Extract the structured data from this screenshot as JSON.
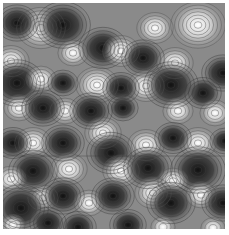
{
  "figure": {
    "background_gray": "#8a8a8a",
    "contour_line_color": "#3a3a3a",
    "colormap": [
      "#111111",
      "#8a8a8a",
      "#ffffff"
    ]
  },
  "blobs": [
    {
      "x": 38,
      "y": 25,
      "r": 16,
      "kind": "max"
    },
    {
      "x": 60,
      "y": 22,
      "r": 18,
      "kind": "min"
    },
    {
      "x": 14,
      "y": 20,
      "r": 14,
      "kind": "min"
    },
    {
      "x": 70,
      "y": 50,
      "r": 10,
      "kind": "max"
    },
    {
      "x": 8,
      "y": 58,
      "r": 12,
      "kind": "max"
    },
    {
      "x": 14,
      "y": 80,
      "r": 18,
      "kind": "min"
    },
    {
      "x": 38,
      "y": 76,
      "r": 10,
      "kind": "max"
    },
    {
      "x": 60,
      "y": 80,
      "r": 10,
      "kind": "min"
    },
    {
      "x": 94,
      "y": 82,
      "r": 14,
      "kind": "max"
    },
    {
      "x": 100,
      "y": 45,
      "r": 16,
      "kind": "min"
    },
    {
      "x": 16,
      "y": 105,
      "r": 10,
      "kind": "max"
    },
    {
      "x": 62,
      "y": 108,
      "r": 10,
      "kind": "max"
    },
    {
      "x": 40,
      "y": 105,
      "r": 14,
      "kind": "min"
    },
    {
      "x": 88,
      "y": 108,
      "r": 14,
      "kind": "min"
    },
    {
      "x": 152,
      "y": 25,
      "r": 12,
      "kind": "max"
    },
    {
      "x": 195,
      "y": 22,
      "r": 18,
      "kind": "max"
    },
    {
      "x": 220,
      "y": 70,
      "r": 14,
      "kind": "min"
    },
    {
      "x": 118,
      "y": 48,
      "r": 12,
      "kind": "max"
    },
    {
      "x": 140,
      "y": 55,
      "r": 14,
      "kind": "min"
    },
    {
      "x": 172,
      "y": 60,
      "r": 12,
      "kind": "max"
    },
    {
      "x": 200,
      "y": 90,
      "r": 12,
      "kind": "min"
    },
    {
      "x": 143,
      "y": 83,
      "r": 12,
      "kind": "max"
    },
    {
      "x": 118,
      "y": 85,
      "r": 12,
      "kind": "min"
    },
    {
      "x": 168,
      "y": 82,
      "r": 18,
      "kind": "min"
    },
    {
      "x": 175,
      "y": 108,
      "r": 10,
      "kind": "max"
    },
    {
      "x": 212,
      "y": 110,
      "r": 10,
      "kind": "max"
    },
    {
      "x": 120,
      "y": 105,
      "r": 10,
      "kind": "min"
    },
    {
      "x": 30,
      "y": 140,
      "r": 12,
      "kind": "max"
    },
    {
      "x": 60,
      "y": 140,
      "r": 14,
      "kind": "min"
    },
    {
      "x": 10,
      "y": 140,
      "r": 12,
      "kind": "min"
    },
    {
      "x": 100,
      "y": 130,
      "r": 12,
      "kind": "max"
    },
    {
      "x": 108,
      "y": 150,
      "r": 16,
      "kind": "min"
    },
    {
      "x": 143,
      "y": 142,
      "r": 12,
      "kind": "max"
    },
    {
      "x": 195,
      "y": 140,
      "r": 12,
      "kind": "max"
    },
    {
      "x": 170,
      "y": 135,
      "r": 12,
      "kind": "min"
    },
    {
      "x": 222,
      "y": 138,
      "r": 10,
      "kind": "min"
    },
    {
      "x": 30,
      "y": 168,
      "r": 16,
      "kind": "min"
    },
    {
      "x": 66,
      "y": 166,
      "r": 12,
      "kind": "max"
    },
    {
      "x": 8,
      "y": 176,
      "r": 10,
      "kind": "max"
    },
    {
      "x": 118,
      "y": 168,
      "r": 12,
      "kind": "max"
    },
    {
      "x": 145,
      "y": 165,
      "r": 16,
      "kind": "min"
    },
    {
      "x": 195,
      "y": 167,
      "r": 18,
      "kind": "min"
    },
    {
      "x": 170,
      "y": 178,
      "r": 10,
      "kind": "max"
    },
    {
      "x": 40,
      "y": 195,
      "r": 10,
      "kind": "max"
    },
    {
      "x": 60,
      "y": 193,
      "r": 14,
      "kind": "min"
    },
    {
      "x": 18,
      "y": 205,
      "r": 18,
      "kind": "min"
    },
    {
      "x": 86,
      "y": 200,
      "r": 10,
      "kind": "max"
    },
    {
      "x": 110,
      "y": 193,
      "r": 14,
      "kind": "min"
    },
    {
      "x": 150,
      "y": 190,
      "r": 12,
      "kind": "max"
    },
    {
      "x": 168,
      "y": 200,
      "r": 16,
      "kind": "min"
    },
    {
      "x": 198,
      "y": 192,
      "r": 10,
      "kind": "max"
    },
    {
      "x": 220,
      "y": 200,
      "r": 14,
      "kind": "min"
    },
    {
      "x": 10,
      "y": 222,
      "r": 8,
      "kind": "max"
    },
    {
      "x": 45,
      "y": 220,
      "r": 12,
      "kind": "min"
    },
    {
      "x": 75,
      "y": 224,
      "r": 12,
      "kind": "min"
    },
    {
      "x": 160,
      "y": 224,
      "r": 8,
      "kind": "max"
    },
    {
      "x": 125,
      "y": 222,
      "r": 12,
      "kind": "min"
    },
    {
      "x": 210,
      "y": 225,
      "r": 8,
      "kind": "max"
    }
  ]
}
